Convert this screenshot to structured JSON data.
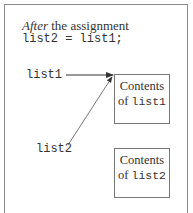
{
  "caption": {
    "italic_word": "After",
    "rest": " the assignment",
    "code": "list2 = list1;"
  },
  "variables": [
    {
      "name": "list1"
    },
    {
      "name": "list2"
    }
  ],
  "boxes": [
    {
      "line1": "Contents",
      "line2_prefix": "of ",
      "line2_code": "list1"
    },
    {
      "line1": "Contents",
      "line2_prefix": "of ",
      "line2_code": "list2"
    }
  ]
}
